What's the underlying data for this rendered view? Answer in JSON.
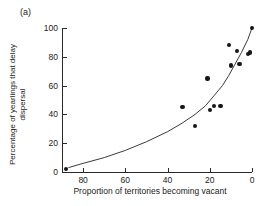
{
  "figure": {
    "panel_label": "(a)",
    "background_color": "#ffffff",
    "point_color": "#151515",
    "axis_color": "#2a2a2a",
    "curve_color": "#3a3a3a"
  },
  "chart_data": {
    "type": "scatter",
    "title": "(a)",
    "xlabel": "Proportion of territories becoming vacant",
    "ylabel": "Percentage of yearlings that delay dispersal",
    "ylabel_lines": [
      "Percentage of yearlings that delay",
      "dispersal"
    ],
    "xlim": [
      90,
      0
    ],
    "ylim": [
      0,
      100
    ],
    "x_axis_reversed": true,
    "grid": false,
    "legend": null,
    "xticks": [
      80,
      60,
      40,
      20,
      0
    ],
    "xticklabels": [
      "80",
      "60",
      "40",
      "20",
      "0"
    ],
    "yticks": [
      0,
      20,
      40,
      60,
      80,
      100
    ],
    "yticklabels": [
      "0",
      "20",
      "40",
      "60",
      "80",
      "100"
    ],
    "tick_direction": "in",
    "points": [
      {
        "x": 88,
        "y": 2
      },
      {
        "x": 33,
        "y": 45
      },
      {
        "x": 27,
        "y": 32
      },
      {
        "x": 21,
        "y": 65
      },
      {
        "x": 20,
        "y": 43
      },
      {
        "x": 18,
        "y": 46
      },
      {
        "x": 15,
        "y": 46
      },
      {
        "x": 11,
        "y": 88
      },
      {
        "x": 10,
        "y": 74
      },
      {
        "x": 7,
        "y": 84
      },
      {
        "x": 6,
        "y": 75
      },
      {
        "x": 2,
        "y": 82
      },
      {
        "x": 1,
        "y": 83
      },
      {
        "x": 0,
        "y": 100
      }
    ],
    "fit_curve": {
      "description": "fitted increasing curve",
      "points": [
        {
          "x": 87,
          "y": 3
        },
        {
          "x": 80,
          "y": 6
        },
        {
          "x": 70,
          "y": 10
        },
        {
          "x": 60,
          "y": 15
        },
        {
          "x": 50,
          "y": 21
        },
        {
          "x": 40,
          "y": 28
        },
        {
          "x": 33,
          "y": 34
        },
        {
          "x": 27,
          "y": 40
        },
        {
          "x": 22,
          "y": 46
        },
        {
          "x": 18,
          "y": 53
        },
        {
          "x": 14,
          "y": 60
        },
        {
          "x": 11,
          "y": 67
        },
        {
          "x": 8,
          "y": 75
        },
        {
          "x": 5,
          "y": 83
        },
        {
          "x": 2,
          "y": 92
        },
        {
          "x": 0,
          "y": 100
        }
      ]
    }
  }
}
